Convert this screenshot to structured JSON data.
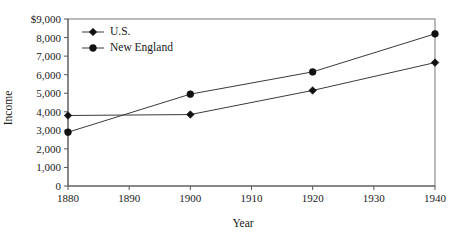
{
  "chart_data": {
    "type": "line",
    "title": "",
    "xlabel": "Year",
    "ylabel": "Income",
    "x": [
      1880,
      1900,
      1920,
      1940
    ],
    "xlim": [
      1880,
      1940
    ],
    "ylim": [
      0,
      9000
    ],
    "xticks": [
      1880,
      1890,
      1900,
      1910,
      1920,
      1930,
      1940
    ],
    "xtick_labels": [
      "1880",
      "1890",
      "1900",
      "1910",
      "1920",
      "1930",
      "1940"
    ],
    "yticks": [
      0,
      1000,
      2000,
      3000,
      4000,
      5000,
      6000,
      7000,
      8000,
      9000
    ],
    "ytick_labels": [
      "0",
      "1,000",
      "2,000",
      "3,000",
      "4,000",
      "5,000",
      "6,000",
      "7,000",
      "8,000",
      "$9,000"
    ],
    "grid": false,
    "legend_position": "top-left",
    "series": [
      {
        "name": "U.S.",
        "marker": "diamond",
        "color": "#111111",
        "values": [
          3800,
          3850,
          5150,
          6650
        ]
      },
      {
        "name": "New England",
        "marker": "circle",
        "color": "#111111",
        "values": [
          2900,
          4950,
          6150,
          8200
        ]
      }
    ]
  },
  "legend": {
    "items": [
      {
        "label": "U.S.",
        "marker": "diamond"
      },
      {
        "label": "New England",
        "marker": "circle"
      }
    ]
  },
  "axes": {
    "x_title": "Year",
    "y_title": "Income"
  }
}
